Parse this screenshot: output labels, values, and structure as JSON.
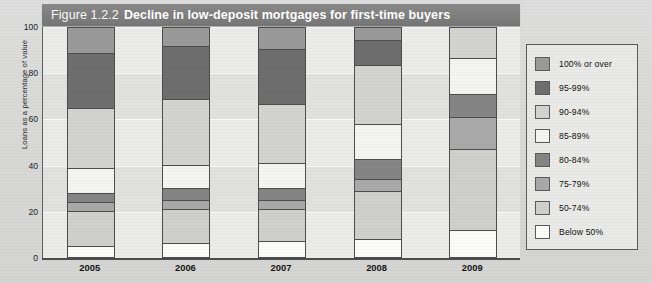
{
  "title": {
    "figure_number": "Figure 1.2.2",
    "figure_name": "Decline in low-deposit mortgages for first-time buyers"
  },
  "axes": {
    "y_label": "Loans as a percentage of value",
    "y_ticks": [
      "100",
      "80",
      "60",
      "40",
      "20",
      "0"
    ],
    "x_labels": [
      "2005",
      "2006",
      "2007",
      "2008",
      "2009"
    ]
  },
  "legend": {
    "items": [
      {
        "label": "100% or over",
        "color": "#9a9a9a"
      },
      {
        "label": "95-99%",
        "color": "#6e6e6e"
      },
      {
        "label": "90-94%",
        "color": "#d3d3d1"
      },
      {
        "label": "85-89%",
        "color": "#f4f4f2"
      },
      {
        "label": "80-84%",
        "color": "#858585"
      },
      {
        "label": "75-79%",
        "color": "#a9a9a9"
      },
      {
        "label": "50-74%",
        "color": "#cfcfcd"
      },
      {
        "label": "Below 50%",
        "color": "#fbfbf9"
      }
    ]
  },
  "chart_data": {
    "type": "bar",
    "stacked": true,
    "title": "Decline in low-deposit mortgages for first-time buyers",
    "xlabel": "",
    "ylabel": "Loans as a percentage of value",
    "ylim": [
      0,
      100
    ],
    "grid": false,
    "legend_position": "right",
    "categories": [
      "2005",
      "2006",
      "2007",
      "2008",
      "2009"
    ],
    "series": [
      {
        "name": "Below 50%",
        "color": "#fbfbf9",
        "values": [
          5,
          6,
          7,
          8,
          12
        ]
      },
      {
        "name": "50-74%",
        "color": "#cfcfcd",
        "values": [
          15,
          15,
          14,
          21,
          35
        ]
      },
      {
        "name": "75-79%",
        "color": "#a9a9a9",
        "values": [
          4,
          4,
          4,
          5,
          14
        ]
      },
      {
        "name": "80-84%",
        "color": "#858585",
        "values": [
          4,
          5,
          5,
          9,
          10
        ]
      },
      {
        "name": "85-89%",
        "color": "#f4f4f2",
        "values": [
          11,
          10,
          11,
          15,
          16
        ]
      },
      {
        "name": "90-94%",
        "color": "#d3d3d1",
        "values": [
          26,
          29,
          26,
          26,
          13
        ]
      },
      {
        "name": "95-99%",
        "color": "#6e6e6e",
        "values": [
          24,
          23,
          24,
          11,
          0
        ]
      },
      {
        "name": "100% or over",
        "color": "#9a9a9a",
        "values": [
          11,
          8,
          9,
          5,
          0
        ]
      }
    ]
  }
}
